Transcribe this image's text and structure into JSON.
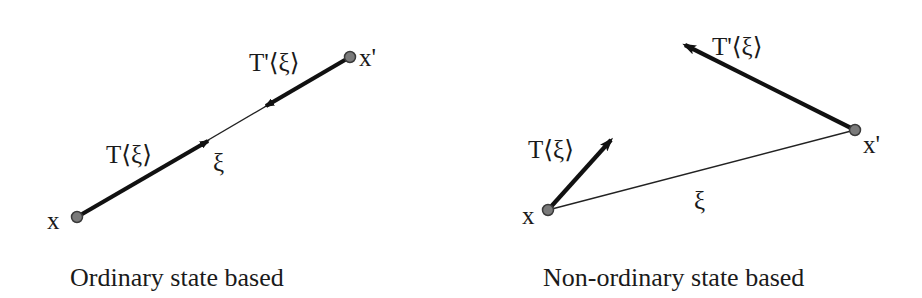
{
  "colors": {
    "background": "#ffffff",
    "stroke": "#111111",
    "node_fill": "#7a7a7a",
    "node_stroke": "#3a3a3a",
    "text": "#1a1a1a"
  },
  "panels": [
    {
      "id": "ordinary",
      "caption": "Ordinary state based",
      "node_x": {
        "label": "x",
        "pos": [
          77,
          217
        ]
      },
      "node_xp": {
        "label": "x'",
        "pos": [
          350,
          57
        ]
      },
      "bond": {
        "label": "ξ",
        "from": [
          77,
          217
        ],
        "to": [
          350,
          57
        ]
      },
      "force_T": {
        "label": "T⟨ξ⟩",
        "from": [
          77,
          217
        ],
        "to": [
          208,
          141
        ]
      },
      "force_Tp": {
        "label": "T'⟨ξ⟩",
        "from": [
          350,
          57
        ],
        "to": [
          266,
          106
        ]
      }
    },
    {
      "id": "non-ordinary",
      "caption": "Non-ordinary state based",
      "node_x": {
        "label": "x",
        "pos": [
          548,
          210
        ]
      },
      "node_xp": {
        "label": "x'",
        "pos": [
          855,
          130
        ]
      },
      "bond": {
        "label": "ξ",
        "from": [
          548,
          210
        ],
        "to": [
          855,
          130
        ]
      },
      "force_T": {
        "label": "T⟨ξ⟩",
        "from": [
          548,
          210
        ],
        "to": [
          611,
          140
        ]
      },
      "force_Tp": {
        "label": "T'⟨ξ⟩",
        "from": [
          855,
          130
        ],
        "to": [
          685,
          45
        ]
      }
    }
  ]
}
